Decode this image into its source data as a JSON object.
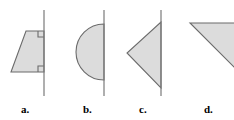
{
  "figure": {
    "width": 234,
    "height": 120,
    "background_color": "#ffffff",
    "style": {
      "shape_fill_color": "#dcdcdc",
      "shape_stroke_color": "#6b6b6b",
      "axis_line_color": "#7a7a7a",
      "right_angle_mark_color": "#6b6b6b",
      "label_color": "#000000"
    }
  },
  "items": [
    {
      "key": "a",
      "label": "a.",
      "shape_name": "trapezoid",
      "axis_line": {
        "x": 44,
        "y_top": 10,
        "y_bottom": 96
      },
      "vertices": [
        {
          "x": 26,
          "y": 31
        },
        {
          "x": 44,
          "y": 31
        },
        {
          "x": 44,
          "y": 72
        },
        {
          "x": 11,
          "y": 72
        }
      ],
      "right_angle_marks": [
        {
          "x": 44,
          "y": 31,
          "size": 6,
          "corner": "top"
        },
        {
          "x": 44,
          "y": 72,
          "size": 6,
          "corner": "bottom"
        }
      ]
    },
    {
      "key": "b",
      "label": "b.",
      "shape_name": "semicircle",
      "axis_line": {
        "x": 104,
        "y_top": 10,
        "y_bottom": 96
      },
      "center": {
        "x": 104,
        "y": 52
      },
      "radius": 28,
      "bulge_side": "left"
    },
    {
      "key": "c",
      "label": "c.",
      "shape_name": "triangle",
      "axis_line": {
        "x": 161,
        "y_top": 10,
        "y_bottom": 96
      },
      "vertices": [
        {
          "x": 161,
          "y": 22
        },
        {
          "x": 161,
          "y": 88
        },
        {
          "x": 127,
          "y": 53
        }
      ]
    },
    {
      "key": "d",
      "label": "d.",
      "shape_name": "triangle",
      "axis_line": null,
      "vertices": [
        {
          "x": 190,
          "y": 23
        },
        {
          "x": 248,
          "y": 23
        },
        {
          "x": 248,
          "y": 81
        }
      ],
      "clipped_by_frame_edge": "right"
    }
  ]
}
